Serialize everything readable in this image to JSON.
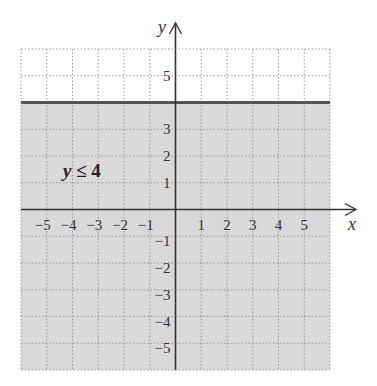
{
  "chart_data": {
    "type": "area",
    "title": "",
    "xlabel": "x",
    "ylabel": "y",
    "xlim": [
      -6,
      6
    ],
    "ylim": [
      -6,
      6
    ],
    "grid": true,
    "x_ticks": [
      -5,
      -4,
      -3,
      -2,
      -1,
      1,
      2,
      3,
      4,
      5
    ],
    "y_ticks": [
      -5,
      -4,
      -3,
      -2,
      -1,
      1,
      2,
      3,
      5
    ],
    "x_tick_labels": [
      "−5",
      "−4",
      "−3",
      "−2",
      "−1",
      "1",
      "2",
      "3",
      "4",
      "5"
    ],
    "y_tick_labels": [
      "5",
      "3",
      "2",
      "1",
      "−1",
      "−2",
      "−3",
      "−4",
      "−5"
    ],
    "series": [
      {
        "name": "y ≤ 4",
        "kind": "inequality",
        "boundary": {
          "equation": "y = 4",
          "style": "solid"
        },
        "shaded_region": "below",
        "values": [
          {
            "x": -6,
            "y": 4
          },
          {
            "x": 6,
            "y": 4
          }
        ]
      }
    ],
    "annotations": [
      {
        "text": "y ≤ 4",
        "x": -4.3,
        "y": 1.5
      }
    ]
  },
  "labels": {
    "x_axis": "x",
    "y_axis": "y",
    "annotation_var": "y",
    "annotation_rest": " ≤ 4"
  },
  "colors": {
    "shade": "#d9d9d9",
    "boundary": "#555555",
    "axis": "#333333",
    "grid": "#9a9a9a"
  }
}
